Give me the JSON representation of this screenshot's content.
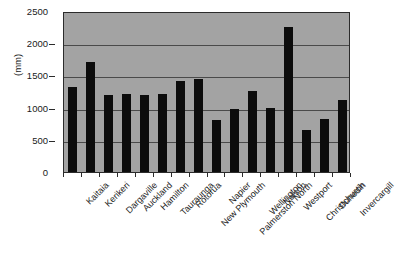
{
  "chart_data": {
    "type": "bar",
    "title": "",
    "xlabel": "",
    "ylabel": "(mm)",
    "ylim": [
      0,
      2500
    ],
    "ytick_values": [
      0,
      500,
      1000,
      1500,
      2000,
      2500
    ],
    "ytick_labels": [
      "0",
      "500",
      "1000",
      "1500",
      "2000",
      "2500"
    ],
    "grid": true,
    "legend": "none",
    "bar_color": "#0c0c0c",
    "plot_background": "#a3a3a3",
    "categories": [
      "Kaitaia",
      "Kerikeri",
      "Dargaville",
      "Auckland",
      "Hamilton",
      "Tauraunga",
      "Rotorua",
      "New Plymouth",
      "Napier",
      "Palmerston North",
      "Wellington",
      "Nelson",
      "Westport",
      "Christchurch",
      "Dunedin",
      "Invercargill"
    ],
    "values": [
      1320,
      1710,
      1190,
      1210,
      1200,
      1210,
      1410,
      1440,
      810,
      980,
      1260,
      1000,
      2250,
      650,
      820,
      1120
    ]
  }
}
